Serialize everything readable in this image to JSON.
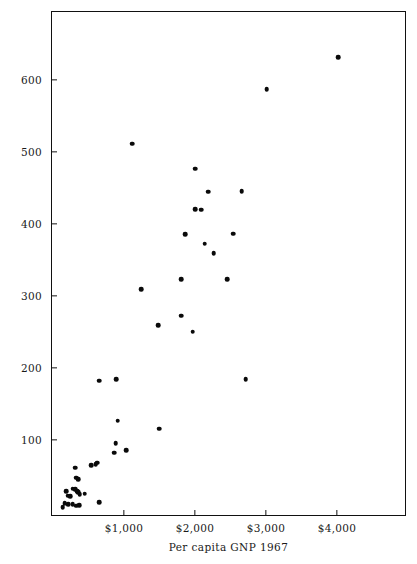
{
  "chart_data": {
    "type": "scatter",
    "title": "",
    "xlabel": "Per capita GNP 1967",
    "ylabel": "Per capita steel consumption (kgs)",
    "xtick_labels": [
      "$1,000",
      "$2,000",
      "$3,000",
      "$4,000"
    ],
    "xtick_values": [
      1000,
      2000,
      3000,
      4000
    ],
    "ytick_labels": [
      "100",
      "200",
      "300",
      "400",
      "500",
      "600"
    ],
    "ytick_values": [
      100,
      200,
      300,
      400,
      500,
      600
    ],
    "xlim": [
      0,
      4960
    ],
    "ylim": [
      0,
      700
    ],
    "grid": false,
    "legend": null,
    "marker_color": "#0a0a0a",
    "frame_color": "#111111",
    "background": "#ffffff",
    "n_points": 48,
    "points": [
      {
        "x": 4000,
        "y": 633
      },
      {
        "x": 2995,
        "y": 589
      },
      {
        "x": 1100,
        "y": 513
      },
      {
        "x": 1990,
        "y": 478
      },
      {
        "x": 2645,
        "y": 447
      },
      {
        "x": 2175,
        "y": 446
      },
      {
        "x": 1985,
        "y": 422
      },
      {
        "x": 2075,
        "y": 421
      },
      {
        "x": 2520,
        "y": 388
      },
      {
        "x": 1845,
        "y": 387
      },
      {
        "x": 2125,
        "y": 374
      },
      {
        "x": 2250,
        "y": 361
      },
      {
        "x": 1795,
        "y": 325
      },
      {
        "x": 2440,
        "y": 325
      },
      {
        "x": 1230,
        "y": 311
      },
      {
        "x": 1790,
        "y": 274
      },
      {
        "x": 1465,
        "y": 261
      },
      {
        "x": 1955,
        "y": 252
      },
      {
        "x": 2700,
        "y": 186
      },
      {
        "x": 880,
        "y": 186
      },
      {
        "x": 640,
        "y": 184
      },
      {
        "x": 900,
        "y": 128
      },
      {
        "x": 1480,
        "y": 117
      },
      {
        "x": 870,
        "y": 97
      },
      {
        "x": 845,
        "y": 84
      },
      {
        "x": 1020,
        "y": 87
      },
      {
        "x": 525,
        "y": 66
      },
      {
        "x": 585,
        "y": 68
      },
      {
        "x": 605,
        "y": 70
      },
      {
        "x": 300,
        "y": 63
      },
      {
        "x": 315,
        "y": 49
      },
      {
        "x": 345,
        "y": 47
      },
      {
        "x": 265,
        "y": 34
      },
      {
        "x": 300,
        "y": 33
      },
      {
        "x": 330,
        "y": 30
      },
      {
        "x": 345,
        "y": 29
      },
      {
        "x": 360,
        "y": 26
      },
      {
        "x": 430,
        "y": 27
      },
      {
        "x": 170,
        "y": 30
      },
      {
        "x": 195,
        "y": 24
      },
      {
        "x": 230,
        "y": 23
      },
      {
        "x": 640,
        "y": 15
      },
      {
        "x": 150,
        "y": 14
      },
      {
        "x": 200,
        "y": 12
      },
      {
        "x": 265,
        "y": 12
      },
      {
        "x": 310,
        "y": 10
      },
      {
        "x": 355,
        "y": 11
      },
      {
        "x": 120,
        "y": 8
      }
    ]
  },
  "figure": {
    "caption": ""
  }
}
